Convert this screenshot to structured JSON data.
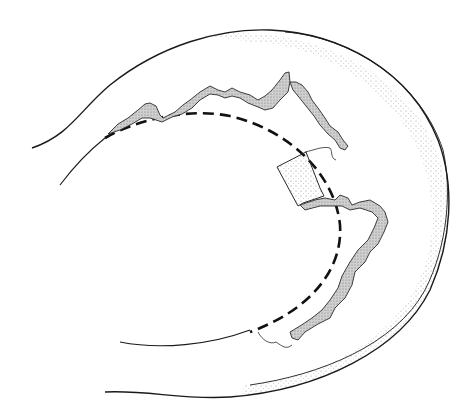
{
  "diagram": {
    "title": "",
    "colors": {
      "background": "#ffffff",
      "line": "#1a1a1a",
      "stipple": "#8a8a8a",
      "jagged_fill": "#c8c8c8"
    },
    "labels": []
  }
}
